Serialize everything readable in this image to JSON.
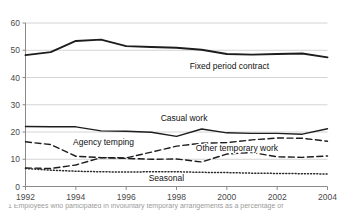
{
  "chart_data": {
    "type": "line",
    "title": "",
    "xlabel": "",
    "ylabel": "",
    "xlim": [
      1992,
      2004
    ],
    "ylim": [
      0,
      60
    ],
    "grid": true,
    "grid_axis": "y",
    "legend": "inline-annotations",
    "x": [
      1992,
      1993,
      1994,
      1995,
      1996,
      1997,
      1998,
      1999,
      2000,
      2001,
      2002,
      2003,
      2004
    ],
    "y_ticks": [
      "0",
      "10",
      "20",
      "30",
      "40",
      "50",
      "60"
    ],
    "x_ticks": [
      "1992",
      "1994",
      "1996",
      "1998",
      "2000",
      "2002",
      "2004"
    ],
    "series": [
      {
        "name": "Fixed period contract",
        "style": "solid",
        "width": 1.9,
        "color": "#1d1d1d",
        "label_x": 2000.1,
        "label_y": 43.0,
        "values": [
          48.2,
          49.3,
          53.4,
          53.9,
          51.5,
          51.2,
          50.9,
          50.2,
          48.6,
          48.4,
          48.6,
          48.8,
          47.4
        ]
      },
      {
        "name": "Casual work",
        "style": "solid",
        "width": 1.4,
        "color": "#1d1d1d",
        "label_x": 1998.3,
        "label_y": 24.2,
        "values": [
          22.0,
          21.9,
          21.9,
          20.4,
          20.3,
          19.9,
          18.4,
          21.1,
          19.7,
          19.5,
          19.5,
          19.2,
          21.2
        ]
      },
      {
        "name": "Agency temping",
        "style": "dashed",
        "width": 1.4,
        "color": "#1d1d1d",
        "label_x": 1995.1,
        "label_y": 15.1,
        "values": [
          16.4,
          15.4,
          11.1,
          10.6,
          10.5,
          12.6,
          14.8,
          15.9,
          16.1,
          17.1,
          17.8,
          17.7,
          16.6
        ]
      },
      {
        "name": "Other temporary work",
        "style": "dashed",
        "width": 1.4,
        "color": "#1d1d1d",
        "label_x": 2000.4,
        "label_y": 13.1,
        "values": [
          6.8,
          6.6,
          7.9,
          10.6,
          10.3,
          10.0,
          10.1,
          9.0,
          11.9,
          12.5,
          10.9,
          10.7,
          11.2
        ]
      },
      {
        "name": "Seasonal",
        "style": "dotted",
        "width": 1.5,
        "color": "#2a2a2a",
        "label_x": 1997.6,
        "label_y": 2.0,
        "values": [
          6.6,
          6.0,
          5.6,
          5.4,
          5.3,
          5.4,
          5.4,
          5.2,
          5.1,
          4.9,
          4.8,
          4.7,
          4.6
        ]
      }
    ]
  },
  "fragments": {
    "top_cut": "",
    "bottom_cut": "1  Employees who participated in involuntary  temporary  arrangements  as  a  percentage  of"
  },
  "colors": {
    "grid": "#c9c9c9",
    "axis": "#8a8a8a",
    "tick_text": "#4a4a4a",
    "line": "#1d1d1d"
  }
}
